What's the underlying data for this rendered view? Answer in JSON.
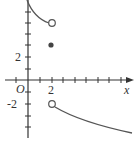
{
  "diagram": {
    "type": "piecewise-function-graph",
    "axes": {
      "x_label": "x",
      "origin_label": "O",
      "x_tick_label": "2",
      "y_tick_labels": [
        "2",
        "-2"
      ],
      "x_ticks": [
        -1,
        1,
        2,
        3,
        4,
        5,
        6,
        7,
        8,
        9
      ],
      "y_ticks": [
        -4,
        -3,
        -2,
        -1,
        1,
        2,
        3,
        4,
        5,
        6
      ]
    },
    "pieces": [
      {
        "name": "left-branch",
        "domain": "x < 2",
        "from": [
          0,
          6.3
        ],
        "to": [
          2,
          5
        ],
        "end": "open"
      },
      {
        "name": "point",
        "at": [
          2,
          3
        ],
        "marker": "filled"
      },
      {
        "name": "right-branch",
        "domain": "x > 2",
        "from": [
          2,
          -2
        ],
        "to": [
          9,
          -4.6
        ],
        "start": "open"
      }
    ],
    "colors": {
      "curve": "#555555",
      "axis": "#333333",
      "dot": "#444444"
    }
  }
}
